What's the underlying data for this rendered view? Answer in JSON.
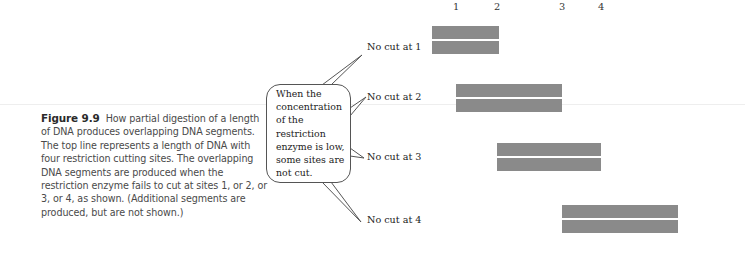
{
  "caption": {
    "figure_number": "Figure 9.9",
    "text": "How partial digestion of a length of DNA produces overlapping DNA segments. The top line represents a length of DNA with four restriction cutting sites. The overlapping DNA segments are produced when the restriction enzyme fails to cut at sites 1, or 2, or 3, or 4, as shown. (Additional segments are produced, but are not shown.)"
  },
  "callout": {
    "text": "When the concentration of the restriction enzyme is low, some sites are not cut."
  },
  "sites": [
    {
      "label": "1"
    },
    {
      "label": "2"
    },
    {
      "label": "3"
    },
    {
      "label": "4"
    }
  ],
  "segments": [
    {
      "label": "No cut at 1"
    },
    {
      "label": "No cut at 2"
    },
    {
      "label": "No cut at 3"
    },
    {
      "label": "No cut at 4"
    }
  ],
  "colors": {
    "segment_fill": "#8a8a8a",
    "caption_text": "#4a4a4a"
  }
}
